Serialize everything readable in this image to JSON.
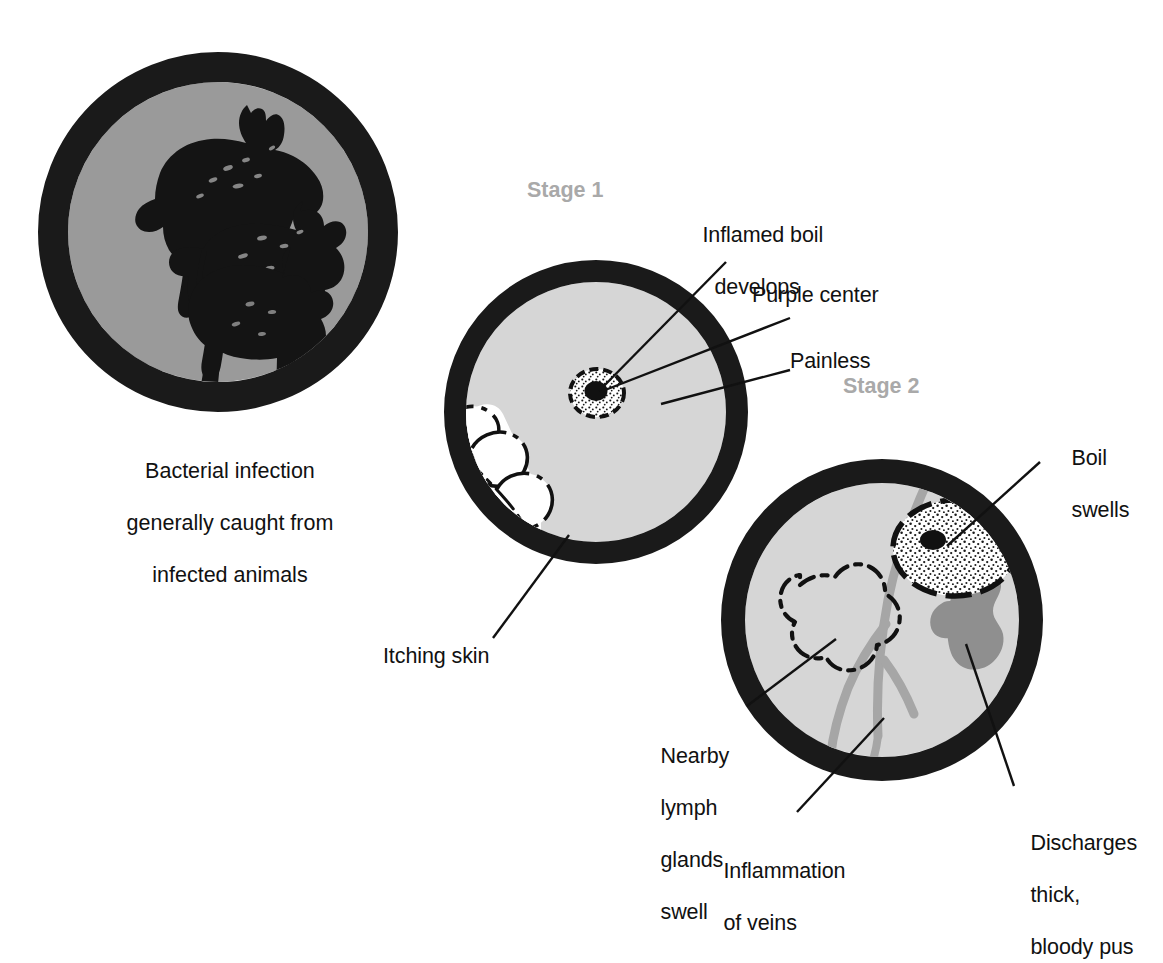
{
  "figure": {
    "title_absent": true,
    "background_color": "#ffffff",
    "ink_color": "#111111",
    "stage_label_color": "#a9a9a9"
  },
  "panels": [
    {
      "id": "source",
      "name": "infection-source",
      "ring_color": "#1a1a1a",
      "fill_color": "#9a9a9a",
      "center": {
        "x": 218,
        "y": 232
      },
      "outer_radius": 180,
      "ring_width": 30,
      "contents": [
        "horse-silhouette",
        "cow-silhouette",
        "sheep-silhouette"
      ],
      "caption_lines": [
        "Bacterial infection",
        "generally caught from",
        "infected animals"
      ]
    },
    {
      "id": "stage1",
      "name": "stage-1-panel",
      "stage_label": "Stage 1",
      "ring_color": "#1a1a1a",
      "fill_color": "#d6d6d6",
      "center": {
        "x": 596,
        "y": 412
      },
      "outer_radius": 152,
      "ring_width": 22,
      "boil": {
        "cx": 597,
        "cy": 393,
        "rx": 27,
        "ry": 24,
        "center_dot_r": 11
      },
      "contents": [
        "scratching-hand",
        "small-stippled-boil"
      ]
    },
    {
      "id": "stage2",
      "name": "stage-2-panel",
      "stage_label": "Stage 2",
      "ring_color": "#1a1a1a",
      "fill_color": "#d6d6d6",
      "vein_color": "#a6a6a6",
      "discharge_color": "#8f8f8f",
      "center": {
        "x": 882,
        "y": 620
      },
      "outer_radius": 161,
      "ring_width": 24,
      "boil": {
        "cx": 955,
        "cy": 548,
        "rx": 62,
        "ry": 48
      },
      "contents": [
        "large-stippled-boil",
        "lymph-gland-outline",
        "inflamed-veins",
        "pus-discharge"
      ]
    }
  ],
  "callouts": [
    {
      "id": "inflamed-boil",
      "lines": [
        "Inflamed boil",
        "develops"
      ],
      "align": "left",
      "x": 679,
      "y": 196
    },
    {
      "id": "purple-center",
      "lines": [
        "Purple center"
      ],
      "align": "left",
      "x": 752,
      "y": 282
    },
    {
      "id": "painless",
      "lines": [
        "Painless"
      ],
      "align": "left",
      "x": 790,
      "y": 348
    },
    {
      "id": "itching-skin",
      "lines": [
        "Itching skin"
      ],
      "align": "left",
      "x": 383,
      "y": 643
    },
    {
      "id": "boil-swells",
      "lines": [
        "Boil",
        "swells"
      ],
      "align": "left",
      "x": 1048,
      "y": 419
    },
    {
      "id": "lymph-glands",
      "lines": [
        "Nearby",
        "lymph",
        "glands",
        "swell"
      ],
      "align": "left",
      "x": 637,
      "y": 717
    },
    {
      "id": "inflammation",
      "lines": [
        "Inflammation",
        "of veins"
      ],
      "align": "left",
      "x": 700,
      "y": 832
    },
    {
      "id": "discharges",
      "lines": [
        "Discharges",
        "thick,",
        "bloody pus"
      ],
      "align": "left",
      "x": 1007,
      "y": 804
    }
  ],
  "caption": {
    "lines": [
      "Bacterial infection",
      "generally caught from",
      "infected animals"
    ],
    "x": 218,
    "y": 432
  },
  "stage_labels": [
    {
      "text": "Stage 1",
      "x": 527,
      "y": 188
    },
    {
      "text": "Stage 2",
      "x": 843,
      "y": 384
    }
  ]
}
